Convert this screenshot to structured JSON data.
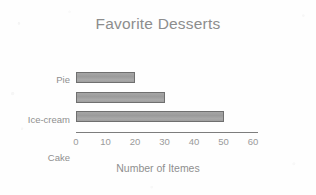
{
  "chart_data": {
    "type": "bar",
    "orientation": "horizontal",
    "title": "Favorite Desserts",
    "xlabel": "Number of Itemes",
    "ylabel": "",
    "categories": [
      "Pie",
      "Ice-cream",
      "Cake"
    ],
    "values": [
      20,
      30,
      50
    ],
    "xlim": [
      0,
      60
    ],
    "xticks": [
      "0",
      "10",
      "20",
      "30",
      "40",
      "50",
      "60"
    ],
    "xtick_values": [
      0,
      10,
      20,
      30,
      40,
      50,
      60
    ],
    "grid": false,
    "legend": false,
    "series": [
      {
        "name": "Number of Itemes",
        "values": [
          20,
          30,
          50
        ]
      }
    ],
    "colors": {
      "bar_fill": "#9e9e9e",
      "bar_border": "#6f6f6f",
      "title_text": "#8d8d8d",
      "label_text": "#8f8f8f",
      "tick_text": "#9a9a9a",
      "axis_line": "#7d7d7d",
      "background": "#fefefe"
    }
  }
}
